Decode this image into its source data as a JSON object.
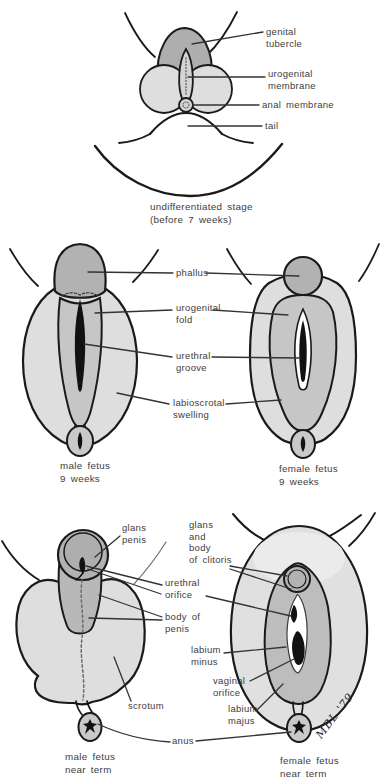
{
  "figure": {
    "colors": {
      "background": "#ffffff",
      "ink": "#1a1a1a",
      "dark_gray": "#b2b2b2",
      "mid_gray": "#c6c6c6",
      "light_gray": "#dedede",
      "label_text": "#3d3d3d"
    }
  },
  "top": {
    "labels": {
      "genital_tubercle": [
        "genital",
        "tubercle"
      ],
      "urogenital_membrane": [
        "urogenital",
        "membrane"
      ],
      "anal_membrane": [
        "anal membrane"
      ],
      "tail": [
        "tail"
      ]
    },
    "caption": [
      "undifferentiated stage",
      "(before 7 weeks)"
    ]
  },
  "middle": {
    "labels": {
      "phallus": [
        "phallus"
      ],
      "urogenital_fold": [
        "urogenital",
        "fold"
      ],
      "urethral_groove": [
        "urethral",
        "groove"
      ],
      "labioscrotal_swelling": [
        "labioscrotal",
        "swelling"
      ]
    },
    "captions": {
      "male": [
        "male fetus",
        "9 weeks"
      ],
      "female": [
        "female fetus",
        "9 weeks"
      ]
    }
  },
  "bottom": {
    "labels": {
      "glans_penis": [
        "glans",
        "penis"
      ],
      "glans_body_clitoris": [
        "glans",
        "and",
        "body",
        "of clitoris"
      ],
      "urethral_orifice": [
        "urethral",
        "orifice"
      ],
      "body_of_penis": [
        "body of",
        "penis"
      ],
      "labium_minus": [
        "labium",
        "minus"
      ],
      "vaginal_orifice": [
        "vaginal",
        "orifice"
      ],
      "labium_majus": [
        "labium",
        "majus"
      ],
      "scrotum": [
        "scrotum"
      ],
      "anus": [
        "anus"
      ]
    },
    "captions": {
      "male": [
        "male fetus",
        "near term"
      ],
      "female": [
        "female fetus",
        "near term"
      ]
    },
    "signature": "MBL '79"
  }
}
